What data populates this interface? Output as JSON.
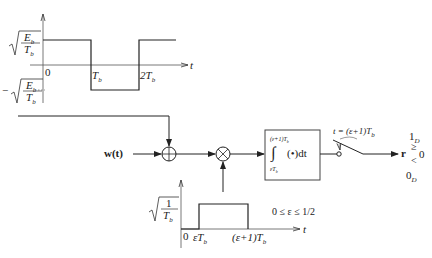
{
  "top_waveform": {
    "amplitude_pos_num": "E",
    "amplitude_pos_num_sub": "b",
    "amplitude_den": "T",
    "amplitude_den_sub": "b",
    "neg_sign": "−",
    "axis_t": "t",
    "tick_0": "0",
    "tick_Tb": "T",
    "tick_Tb_sub": "b",
    "tick_2Tb": "2T",
    "tick_2Tb_sub": "b"
  },
  "main_path": {
    "input_label": "w(t)",
    "adder_symbol": "⊕",
    "multiplier_symbol": "⊗",
    "integrator_upper": "(ε+1)T",
    "integrator_upper_sub": "b",
    "integrator_lower": "εT",
    "integrator_lower_sub": "b",
    "integrator_symbol": "∫",
    "integrator_body": "(•)dt",
    "sampler_label": "t = (ε+1)T",
    "sampler_label_sub": "b",
    "output_label": "r",
    "decision_upper": "1",
    "decision_upper_sub": "D",
    "decision_ge": "≥",
    "decision_threshold": "0",
    "decision_lt": "<",
    "decision_lower": "0",
    "decision_lower_sub": "D"
  },
  "bottom_waveform": {
    "amplitude_num": "1",
    "amplitude_den": "T",
    "amplitude_den_sub": "b",
    "axis_t": "t",
    "tick_0": "0",
    "tick_start": "εT",
    "tick_start_sub": "b",
    "tick_end": "(ε+1)T",
    "tick_end_sub": "b",
    "constraint": "0 ≤ ε ≤ 1/2"
  }
}
